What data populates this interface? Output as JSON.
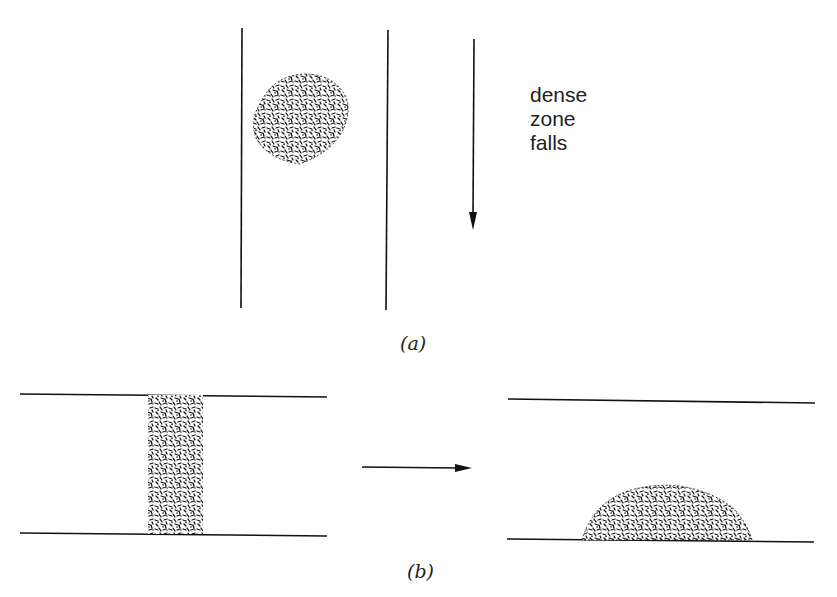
{
  "panel_a": {
    "caption": "(a)",
    "label_lines": [
      "dense",
      "zone",
      "falls"
    ],
    "tube": {
      "left_x": 242,
      "right_x": 387,
      "top_y": 28,
      "bottom_y": 310
    },
    "blob": {
      "cx": 310,
      "cy": 118,
      "rx": 58,
      "ry": 45
    },
    "arrow": {
      "x": 474,
      "y1": 38,
      "y2": 230,
      "direction": "down"
    }
  },
  "panel_b": {
    "caption": "(b)",
    "arrow": {
      "x1": 362,
      "x2": 472,
      "y": 468,
      "direction": "right"
    },
    "before": {
      "top_y": 395,
      "bottom_y": 534,
      "x1": 20,
      "x2": 327,
      "band_x1": 148,
      "band_x2": 203
    },
    "after": {
      "top_y": 401,
      "bottom_y": 541,
      "x1": 508,
      "x2": 815,
      "heap_x1": 582,
      "heap_x2": 752,
      "heap_top_y": 485
    }
  },
  "colors": {
    "ink": "#111111",
    "background": "#ffffff"
  }
}
